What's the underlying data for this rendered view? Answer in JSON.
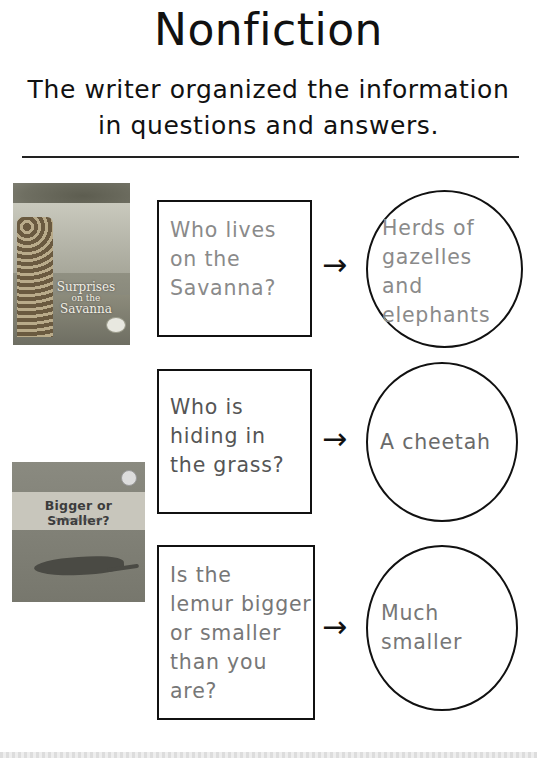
{
  "header": {
    "title": "Nonfiction",
    "subtitle_line1": "The writer organized the information",
    "subtitle_line2": "in questions and answers."
  },
  "books": [
    {
      "title_line1": "Surprises",
      "title_line2": "on the",
      "title_line3": "Savanna",
      "cover_description": "giraffes under acacia tree on the savanna"
    },
    {
      "title": "Bigger or Smaller?",
      "byline": "by Brenda Iasevoli",
      "cover_description": "lizard on rock"
    }
  ],
  "rows": [
    {
      "question_lines": [
        "Who lives",
        "on the",
        "Savanna?"
      ],
      "answer_lines": [
        "Herds of",
        "gazelles",
        "and",
        "elephants"
      ],
      "text_color": "#8a8a8a",
      "arrow": "→"
    },
    {
      "question_lines": [
        "Who is",
        "hiding in",
        "the grass?"
      ],
      "answer_lines": [
        "A cheetah"
      ],
      "text_color": "#555555",
      "answer_color": "#6a6a6a",
      "arrow": "→"
    },
    {
      "question_lines": [
        "Is the",
        "lemur bigger",
        "or smaller",
        "than you",
        "are?"
      ],
      "answer_lines": [
        "Much",
        "smaller"
      ],
      "text_color": "#777777",
      "arrow": "→"
    }
  ]
}
